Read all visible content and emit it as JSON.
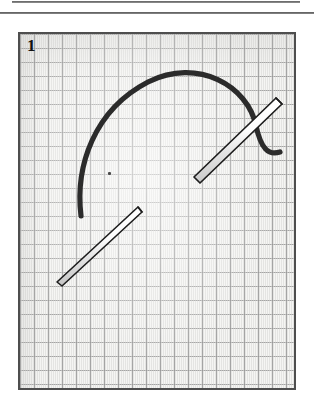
{
  "page": {
    "background_color": "#ffffff",
    "width": 314,
    "height": 407
  },
  "rules": [
    {
      "name": "upper-rule",
      "color": "#4a4a4a"
    },
    {
      "name": "lower-rule",
      "color": "#3f3f3f"
    }
  ],
  "figure": {
    "number_label": "1",
    "panel_border_color": "#4e4e4e",
    "paper_color": "#f4f4f2",
    "grid_line_color": "#969696",
    "grid_cell_px": 14,
    "caption": "",
    "elements": [
      {
        "name": "thread-curve",
        "kind": "curved-thread",
        "color": "#2b2b2b",
        "stroke_px": 5,
        "description": "dark curved thread arcing from lower-left up over the top and hooking down to the right"
      },
      {
        "name": "needle-upper",
        "kind": "needle",
        "fill_color": "#fdfdfd",
        "outline_color": "#1d1d1d",
        "angle_deg": -41,
        "description": "white needle crossing the right end of the thread, tip at lower-left, eye-end at upper-right"
      },
      {
        "name": "needle-lower",
        "kind": "needle",
        "fill_color": "#fdfdfd",
        "outline_color": "#1d1d1d",
        "angle_deg": -39,
        "description": "white needle below-left, sharp point at lower-left, blunt end at upper-right"
      },
      {
        "name": "ink-speck",
        "kind": "mark",
        "color": "#4b4b4b",
        "description": "small stray ink dot on the paper"
      }
    ]
  }
}
